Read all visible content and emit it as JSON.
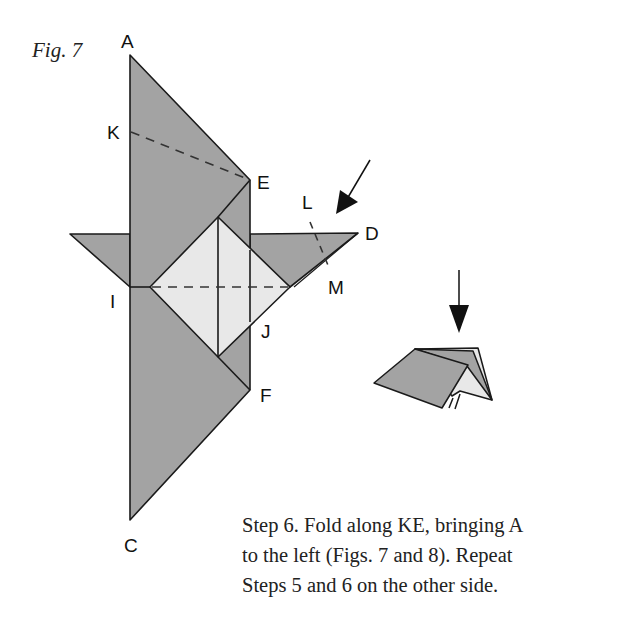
{
  "figure": {
    "label": "Fig. 7",
    "points": {
      "A": "A",
      "K": "K",
      "E": "E",
      "L": "L",
      "D": "D",
      "M": "M",
      "I": "I",
      "J": "J",
      "F": "F",
      "C": "C"
    },
    "colors": {
      "paper_dark": "#a3a3a3",
      "paper_light": "#e8e8e8",
      "line": "#1a1a1a"
    }
  },
  "caption": {
    "lines": [
      "Step 6. Fold along KE, bringing A",
      "to the left (Figs. 7 and 8). Repeat",
      "Steps 5 and 6 on the other side."
    ]
  }
}
